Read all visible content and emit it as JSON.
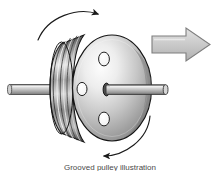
{
  "figure": {
    "caption": "Grooved pulley illustration",
    "background_color": "#ffffff",
    "outline_color": "#1a1a1a",
    "metal_light": "#f2f2f2",
    "metal_mid": "#b5b5b5",
    "metal_dark": "#6e6e6e",
    "metal_darkest": "#3a3a3a",
    "arrow_fill": "#c9c9c9",
    "arrow_stroke": "#8a8a8a",
    "shaft_fill": "#b9b9b9",
    "hole_fill": "#fbfbfb"
  },
  "parts": {
    "pulley_grooves": {
      "label": "grooved pulley rim",
      "groove_count": 5
    },
    "disc_face": {
      "label": "pulley flange face"
    },
    "holes": [
      {
        "label": "lightening hole top"
      },
      {
        "label": "lightening hole left"
      },
      {
        "label": "lightening hole bottom"
      }
    ],
    "hub": {
      "label": "center hub bore"
    },
    "shaft_left": {
      "label": "shaft left end"
    },
    "shaft_right": {
      "label": "shaft right end"
    }
  },
  "annotations": {
    "thrust_arrow": {
      "label": "axial thrust direction arrow",
      "direction": "right"
    },
    "rotation_arrow_top": {
      "label": "rotation direction arrow top",
      "direction": "clockwise"
    },
    "rotation_arrow_bottom": {
      "label": "rotation direction arrow bottom",
      "direction": "clockwise"
    }
  }
}
